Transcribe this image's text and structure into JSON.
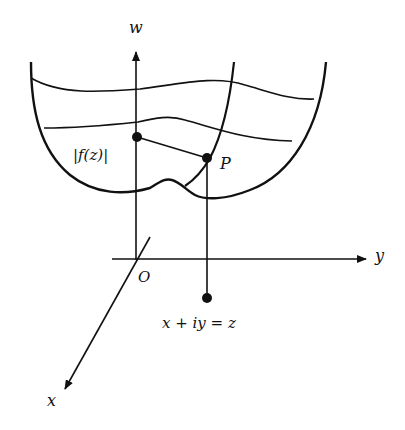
{
  "diagram": {
    "labels": {
      "w_axis": "w",
      "y_axis": "y",
      "x_axis": "x",
      "origin": "O",
      "modulus": "|f(z)|",
      "point": "P",
      "z_point": "x + iy = z"
    },
    "colors": {
      "ink": "#111111",
      "background": "#ffffff"
    }
  }
}
